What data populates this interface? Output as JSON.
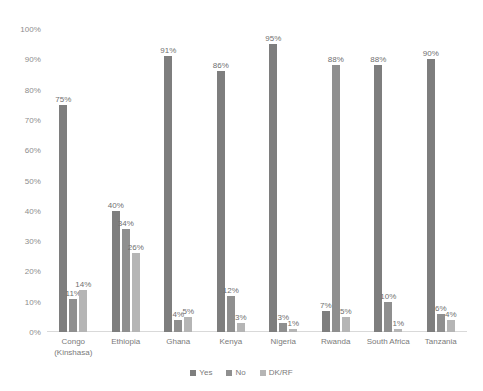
{
  "chart_data": {
    "type": "bar",
    "title": "",
    "subtitle": "",
    "xlabel": "",
    "ylabel": "",
    "ylim": [
      0,
      100
    ],
    "ytick_labels": [
      "100%",
      "90%",
      "80%",
      "70%",
      "60%",
      "50%",
      "40%",
      "30%",
      "20%",
      "10%",
      "0%"
    ],
    "ytick_values": [
      100,
      90,
      80,
      70,
      60,
      50,
      40,
      30,
      20,
      10,
      0
    ],
    "grid": false,
    "legend_position": "bottom",
    "value_label_suffix": "%",
    "categories": [
      "Congo (Kinshasa)",
      "Ethiopia",
      "Ghana",
      "Kenya",
      "Nigeria",
      "Rwanda",
      "South Africa",
      "Tanzania"
    ],
    "category_lines": [
      [
        "Congo",
        "(Kinshasa)"
      ],
      [
        "Ethiopia"
      ],
      [
        "Ghana"
      ],
      [
        "Kenya"
      ],
      [
        "Nigeria"
      ],
      [
        "Rwanda"
      ],
      [
        "South Africa"
      ],
      [
        "Tanzania"
      ]
    ],
    "series": [
      {
        "name": "Yes",
        "color": "#7e7e7e",
        "values": [
          75,
          40,
          91,
          86,
          95,
          7,
          88,
          90
        ],
        "labels": [
          "75%",
          "40%",
          "91%",
          "86%",
          "95%",
          "7%",
          "88%",
          "90%"
        ]
      },
      {
        "name": "No",
        "color": "#8f8f8f",
        "values": [
          11,
          34,
          4,
          12,
          3,
          88,
          10,
          6
        ],
        "labels": [
          "11%",
          "34%",
          "4%",
          "12%",
          "3%",
          "88%",
          "10%",
          "6%"
        ]
      },
      {
        "name": "DK/RF",
        "color": "#b5b5b5",
        "values": [
          14,
          26,
          5,
          3,
          1,
          5,
          1,
          4
        ],
        "labels": [
          "14%",
          "26%",
          "5%",
          "3%",
          "1%",
          "5%",
          "1%",
          "4%"
        ]
      }
    ]
  }
}
